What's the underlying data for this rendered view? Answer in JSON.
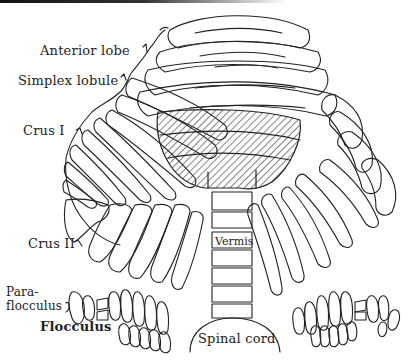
{
  "figure": {
    "labels": {
      "anterior_lobe": "Anterior lobe",
      "simplex_lobule": "Simplex lobule",
      "crus_i": "Crus I",
      "crus_ii": "Crus II",
      "paraflocculus_1": "Para-",
      "paraflocculus_2": "flocculus",
      "flocculus": "Flocculus",
      "vermis": "Vermis",
      "spinal_cord": "Spinal cord"
    },
    "colors": {
      "line": "#222222",
      "background": "#ffffff",
      "hatch": "#333333"
    }
  }
}
